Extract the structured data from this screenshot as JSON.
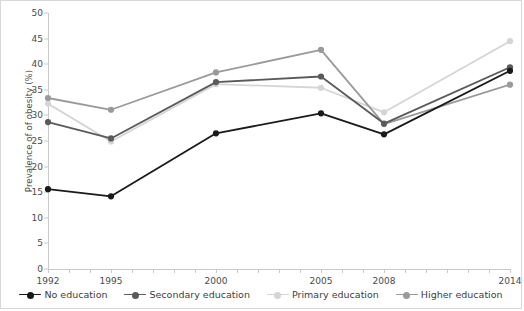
{
  "chart_data": {
    "type": "line",
    "title": "",
    "xlabel": "",
    "ylabel": "Prevalence of of obesity (%)",
    "x": [
      1992,
      1995,
      2000,
      2005,
      2008,
      2014
    ],
    "xtick_labels": [
      "1992",
      "1995",
      "2000",
      "2005",
      "2008",
      "2014"
    ],
    "ytick_labels": [
      "0",
      "5",
      "10",
      "15",
      "20",
      "25",
      "30",
      "35",
      "40",
      "45",
      "50"
    ],
    "ytick_values": [
      0,
      5,
      10,
      15,
      20,
      25,
      30,
      35,
      40,
      45,
      50
    ],
    "ylim": [
      0,
      50
    ],
    "xlim": [
      1992,
      2014
    ],
    "grid": false,
    "legend_position": "bottom",
    "series": [
      {
        "name": "No education",
        "color": "#1a1a1a",
        "values": [
          15.6,
          14.2,
          26.5,
          30.4,
          26.3,
          38.7
        ]
      },
      {
        "name": "Secondary education",
        "color": "#5a5a5a",
        "values": [
          28.7,
          25.5,
          36.5,
          37.6,
          28.4,
          39.4
        ]
      },
      {
        "name": "Primary education",
        "color": "#d5d5d5",
        "values": [
          32.3,
          24.9,
          36.1,
          35.4,
          30.6,
          44.5
        ]
      },
      {
        "name": "Higher education",
        "color": "#9a9a9a",
        "values": [
          33.4,
          31.1,
          38.4,
          42.8,
          28.3,
          36.0
        ]
      }
    ]
  },
  "legend": {
    "items": [
      {
        "label": "No education"
      },
      {
        "label": "Secondary education"
      },
      {
        "label": "Primary education"
      },
      {
        "label": "Higher education"
      }
    ]
  },
  "colors": {
    "axis": "#c9c9c9",
    "text": "#4a4a4a",
    "background": "#ffffff",
    "border": "#d8d8d8"
  }
}
